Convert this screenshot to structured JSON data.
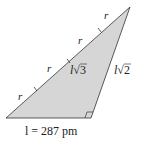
{
  "diagram": {
    "fill_color": "#d6d6d6",
    "stroke_color": "#333333",
    "segment_labels": [
      "r",
      "r",
      "r",
      "r"
    ],
    "hypotenuse_label": {
      "var": "l",
      "root": "3"
    },
    "side_label": {
      "var": "l",
      "root": "2"
    },
    "base_label": "l = 287 pm",
    "right_angle_marker": true
  }
}
